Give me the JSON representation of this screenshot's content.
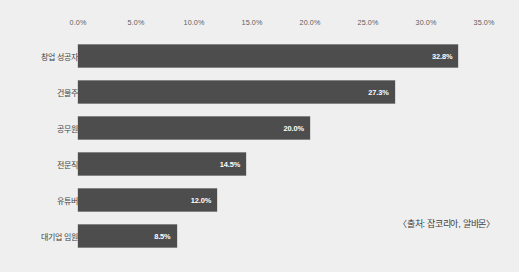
{
  "chart_data": {
    "type": "bar",
    "orientation": "horizontal",
    "title": "",
    "xlabel": "",
    "ylabel": "",
    "categories": [
      "창업 성공자",
      "건물주",
      "공무원",
      "전문직",
      "유튜버",
      "대기업 임원"
    ],
    "values": [
      32.8,
      27.3,
      20.0,
      14.5,
      12.0,
      8.5
    ],
    "value_labels": [
      "32.8%",
      "27.3%",
      "20.0%",
      "14.5%",
      "12.0%",
      "8.5%"
    ],
    "xlim": [
      0,
      35
    ],
    "xticks": [
      0,
      5,
      10,
      15,
      20,
      25,
      30,
      35
    ],
    "xtick_labels": [
      "0.0%",
      "5.0%",
      "10.0%",
      "15.0%",
      "20.0%",
      "25.0%",
      "30.0%",
      "35.0%"
    ],
    "grid": false,
    "legend": null,
    "annotations": [
      "〈출처: 잡코리아, 알바몬〉"
    ],
    "colors": {
      "bar": "#4d4d4d",
      "background": "#efefef",
      "tick_text": "#5d5d5d",
      "category_text": "#454545",
      "value_text": "#ffffff",
      "annotation_text": "#3f3f3f"
    }
  },
  "source_note": "〈출처: 잡코리아, 알바몬〉"
}
